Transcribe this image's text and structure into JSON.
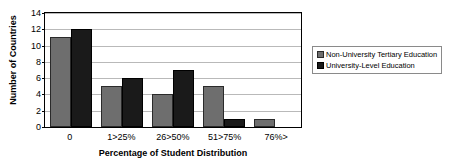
{
  "chart_data": {
    "type": "bar",
    "title": "",
    "xlabel": "Percentage of Student Distribution",
    "ylabel": "Number of Countries",
    "categories": [
      "0",
      "1>25%",
      "26>50%",
      "51>75%",
      "76%>"
    ],
    "series": [
      {
        "name": "Non-University Tertiary Education",
        "color": "#6E6E6E",
        "values": [
          11,
          5,
          4,
          5,
          1
        ]
      },
      {
        "name": "University-Level Education",
        "color": "#1A1A1A",
        "values": [
          12,
          6,
          7,
          1,
          0
        ]
      }
    ],
    "ylim": [
      0,
      14
    ],
    "ytick_step": 2,
    "yticks": [
      "0",
      "2",
      "4",
      "6",
      "8",
      "10",
      "12",
      "14"
    ],
    "grid": true,
    "legend_position": "right-outside"
  },
  "legend": {
    "entries": [
      {
        "label": "Non-University Tertiary Education"
      },
      {
        "label": "University-Level Education"
      }
    ]
  },
  "colors": {
    "series_0": "#6E6E6E",
    "series_1": "#1A1A1A",
    "gridline": "#B9B9B9",
    "axis": "#000000",
    "background": "#FFFFFF"
  }
}
